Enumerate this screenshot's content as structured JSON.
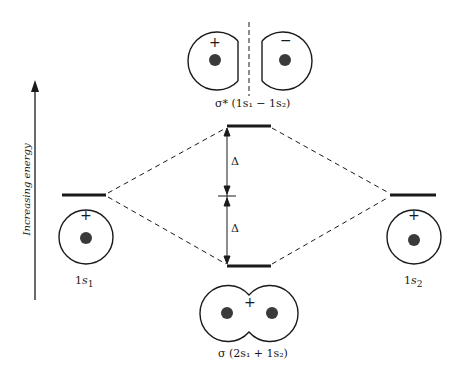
{
  "axis": {
    "label": "Increasing energy"
  },
  "levels": {
    "atomic_left": {
      "label_main": "1",
      "label_var": "s",
      "label_sub": "1",
      "sign": "+"
    },
    "atomic_right": {
      "label_main": "1",
      "label_var": "s",
      "label_sub": "2",
      "sign": "+"
    },
    "antibonding": {
      "label": "σ* (1s₁ − 1s₂)",
      "sign_left": "+",
      "sign_right": "−"
    },
    "bonding": {
      "label": "σ (2s₁ + 1s₂)",
      "sign": "+"
    }
  },
  "splitting": {
    "upper": "Δ",
    "lower": "Δ"
  }
}
